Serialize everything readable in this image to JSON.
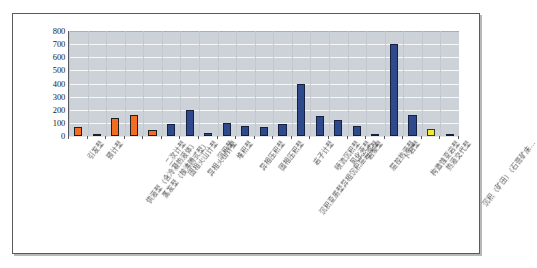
{
  "chart_data": {
    "type": "bar",
    "title": "",
    "subtitle": "",
    "xlabel": "",
    "ylabel": "",
    "ylim": [
      0,
      800
    ],
    "ytick_step": 100,
    "yticks": [
      "800",
      "700",
      "600",
      "500",
      "400",
      "300",
      "200",
      "100",
      "0"
    ],
    "grid": true,
    "legend": "none",
    "plot_background": "#ccd2d8",
    "colors": {
      "series_a": "#f26c21",
      "series_b": "#2e4a8c",
      "series_c": "#f2e73a",
      "gridline": "#ffffff",
      "axis": "#55585c",
      "frame": "#5a5a5a"
    },
    "categories": [
      "引发型",
      "预计型",
      "供液型（含冷凝热液体）",
      "蒸发型（核沸腾式型）",
      "二次计型",
      "固相火山计型",
      "异相火山计型",
      "沉积型",
      "堆积型",
      "异相压积型",
      "固相压积型",
      "沉积变质型异相沉积层岩浆型",
      "岩子计型",
      "喷流沉积型",
      "风化壳型",
      "岩浆型",
      "层控热液型",
      "卜岩型",
      "构造蚀变岩型",
      "热液交代型",
      "沉积（矿田）（石膏矿床…"
    ],
    "values": [
      65,
      18,
      135,
      160,
      45,
      95,
      200,
      25,
      100,
      75,
      65,
      95,
      400,
      150,
      120,
      75,
      10,
      700,
      160,
      50,
      15
    ],
    "series_assignment": [
      "a",
      "a",
      "a",
      "a",
      "a",
      "b",
      "b",
      "b",
      "b",
      "b",
      "b",
      "b",
      "b",
      "b",
      "b",
      "b",
      "b",
      "b",
      "b",
      "c",
      "b"
    ]
  },
  "chart": {
    "yticks": [
      "800",
      "700",
      "600",
      "500",
      "400",
      "300",
      "200",
      "100",
      "0"
    ]
  }
}
